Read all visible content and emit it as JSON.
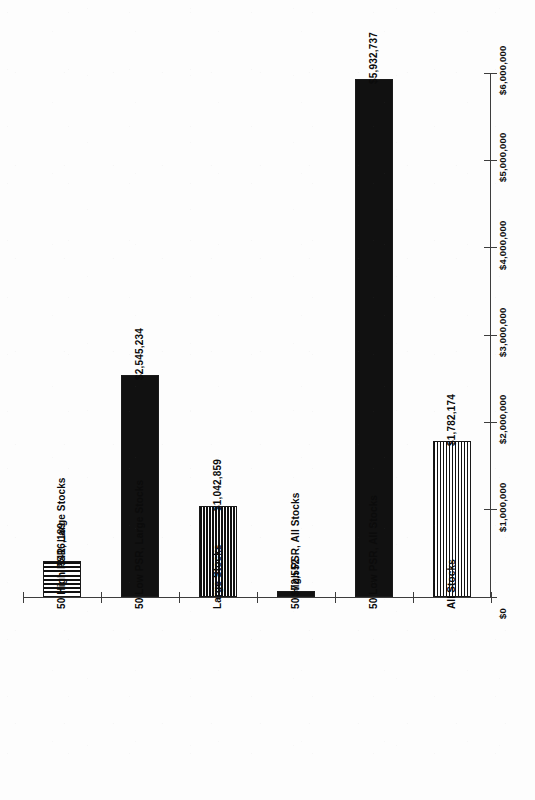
{
  "chart_data": {
    "type": "bar",
    "title": "",
    "xlabel": "",
    "ylabel": "",
    "orientation": "vertical",
    "grid": false,
    "legend": null,
    "axis_position": {
      "y_axis": "right",
      "x_axis": "bottom"
    },
    "ylim": [
      0,
      6000000
    ],
    "ytick_labels": [
      "$0",
      "$1,000,000",
      "$2,000,000",
      "$3,000,000",
      "$4,000,000",
      "$5,000,000",
      "$6,000,000"
    ],
    "ytick_values": [
      0,
      1000000,
      2000000,
      3000000,
      4000000,
      5000000,
      6000000
    ],
    "categories": [
      "50 High PSR, Large Stocks",
      "50 Low PSR, Large Stocks",
      "Large Stocks",
      "50 High PSR, All Stocks",
      "50 Low PSR, All Stocks",
      "All Stocks"
    ],
    "values": [
      416189,
      2545234,
      1042859,
      72552,
      5932737,
      1782174
    ],
    "value_labels": [
      "$416,189",
      "$2,545,234",
      "$1,042,859",
      "$72,552",
      "$5,932,737",
      "$1,782,174"
    ],
    "bar_fills": [
      "horizontal-lines",
      "solid-black",
      "vertical-lines",
      "solid-black",
      "solid-black",
      "vertical-lines"
    ],
    "colors": {
      "bar_outline": "#1a1a1a",
      "bar_solid": "#111111",
      "axis": "#3d3d3d",
      "text": "#0b0b0b",
      "background": "#ffffff"
    }
  }
}
